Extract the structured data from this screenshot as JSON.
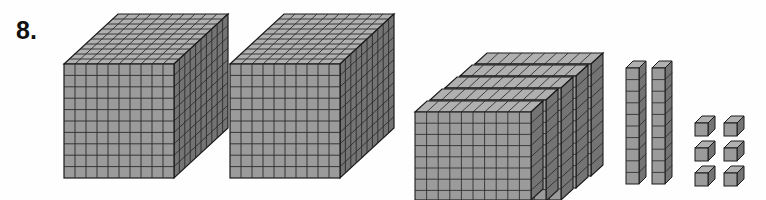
{
  "problem": {
    "number": "8."
  },
  "colors": {
    "front_face": "#9b9b9b",
    "top_face": "#b0b0b0",
    "side_face": "#747474",
    "grid_line": "#2b2b2b",
    "outline": "#1a1a1a",
    "background": "#fefefe",
    "number_color": "#111111"
  },
  "manipulative": {
    "type": "base-ten-blocks",
    "groups": [
      {
        "name": "thousands-cube-1",
        "piece": "cube",
        "place_value": "thousands",
        "unit_value": 1000,
        "count": 1,
        "dimensions": "10 x 10 x 10",
        "label": "thousand cube"
      },
      {
        "name": "thousands-cube-2",
        "piece": "cube",
        "place_value": "thousands",
        "unit_value": 1000,
        "count": 1,
        "dimensions": "10 x 10 x 10",
        "label": "thousand cube"
      },
      {
        "name": "hundreds-flats",
        "piece": "flat",
        "place_value": "hundreds",
        "unit_value": 100,
        "count": 5,
        "dimensions": "10 x 10 x 1",
        "label": "hundred flat"
      },
      {
        "name": "tens-rods",
        "piece": "rod",
        "place_value": "tens",
        "unit_value": 10,
        "count": 2,
        "dimensions": "10 x 1 x 1",
        "label": "ten rod"
      },
      {
        "name": "ones-units",
        "piece": "unit",
        "place_value": "ones",
        "unit_value": 1,
        "count": 6,
        "dimensions": "1 x 1 x 1",
        "label": "one unit",
        "arrangement": "2 columns x 3 rows"
      }
    ],
    "totals": {
      "thousands": 2,
      "hundreds": 5,
      "tens": 2,
      "ones": 6,
      "value": 2526
    }
  }
}
